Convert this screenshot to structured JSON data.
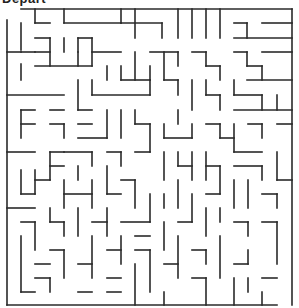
{
  "maze": {
    "start_label": "Depart",
    "wall_color": "#2a2a2a",
    "background": "#ffffff",
    "walls": [
      [
        21,
        9,
        292,
        9
      ],
      [
        7,
        20,
        7,
        305
      ],
      [
        7,
        305,
        277,
        305
      ],
      [
        292,
        9,
        292,
        305
      ],
      [
        21,
        23,
        21,
        50
      ],
      [
        21,
        52,
        35,
        52
      ],
      [
        7,
        52,
        21,
        52
      ],
      [
        21,
        64,
        21,
        80
      ],
      [
        35,
        9,
        35,
        23
      ],
      [
        35,
        23,
        50,
        23
      ],
      [
        64,
        9,
        64,
        23
      ],
      [
        64,
        23,
        121,
        23
      ],
      [
        121,
        9,
        121,
        23
      ],
      [
        121,
        23,
        162,
        23
      ],
      [
        78,
        38,
        92,
        38
      ],
      [
        64,
        38,
        64,
        52
      ],
      [
        35,
        38,
        50,
        38
      ],
      [
        35,
        52,
        50,
        52
      ],
      [
        50,
        38,
        50,
        66
      ],
      [
        35,
        66,
        92,
        66
      ],
      [
        78,
        52,
        78,
        66
      ],
      [
        78,
        38,
        78,
        52
      ],
      [
        92,
        38,
        92,
        66
      ],
      [
        92,
        52,
        121,
        52
      ],
      [
        107,
        66,
        107,
        80
      ],
      [
        135,
        9,
        135,
        38
      ],
      [
        162,
        23,
        162,
        38
      ],
      [
        178,
        9,
        178,
        38
      ],
      [
        192,
        9,
        192,
        38
      ],
      [
        206,
        9,
        206,
        38
      ],
      [
        220,
        9,
        220,
        38
      ],
      [
        234,
        23,
        247,
        23
      ],
      [
        247,
        23,
        247,
        38
      ],
      [
        262,
        23,
        292,
        23
      ],
      [
        234,
        38,
        292,
        38
      ],
      [
        150,
        52,
        178,
        52
      ],
      [
        178,
        52,
        178,
        66
      ],
      [
        192,
        52,
        206,
        52
      ],
      [
        206,
        52,
        206,
        66
      ],
      [
        206,
        66,
        220,
        66
      ],
      [
        220,
        66,
        220,
        80
      ],
      [
        234,
        52,
        247,
        52
      ],
      [
        247,
        52,
        247,
        66
      ],
      [
        247,
        66,
        262,
        66
      ],
      [
        262,
        66,
        262,
        80
      ],
      [
        247,
        80,
        292,
        80
      ],
      [
        262,
        52,
        292,
        52
      ],
      [
        164,
        52,
        164,
        80
      ],
      [
        135,
        52,
        135,
        80
      ],
      [
        150,
        66,
        150,
        80
      ],
      [
        121,
        66,
        121,
        80
      ],
      [
        121,
        80,
        150,
        80
      ],
      [
        7,
        95,
        64,
        95
      ],
      [
        78,
        80,
        78,
        110
      ],
      [
        92,
        80,
        92,
        95
      ],
      [
        92,
        95,
        150,
        95
      ],
      [
        150,
        80,
        150,
        95
      ],
      [
        164,
        80,
        178,
        80
      ],
      [
        178,
        80,
        178,
        95
      ],
      [
        192,
        80,
        192,
        110
      ],
      [
        206,
        80,
        206,
        95
      ],
      [
        206,
        95,
        220,
        95
      ],
      [
        220,
        95,
        220,
        110
      ],
      [
        234,
        80,
        234,
        95
      ],
      [
        234,
        95,
        262,
        95
      ],
      [
        262,
        95,
        262,
        110
      ],
      [
        277,
        95,
        277,
        110
      ],
      [
        234,
        110,
        292,
        110
      ],
      [
        21,
        110,
        21,
        138
      ],
      [
        21,
        110,
        35,
        110
      ],
      [
        21,
        124,
        35,
        124
      ],
      [
        50,
        110,
        64,
        110
      ],
      [
        50,
        124,
        64,
        124
      ],
      [
        64,
        124,
        64,
        138
      ],
      [
        78,
        110,
        92,
        110
      ],
      [
        78,
        124,
        92,
        124
      ],
      [
        78,
        138,
        107,
        138
      ],
      [
        107,
        110,
        107,
        138
      ],
      [
        121,
        110,
        121,
        138
      ],
      [
        135,
        110,
        135,
        124
      ],
      [
        135,
        124,
        150,
        124
      ],
      [
        150,
        124,
        150,
        152
      ],
      [
        164,
        124,
        164,
        138
      ],
      [
        164,
        138,
        192,
        138
      ],
      [
        192,
        124,
        192,
        138
      ],
      [
        178,
        110,
        178,
        124
      ],
      [
        206,
        124,
        220,
        124
      ],
      [
        220,
        124,
        220,
        138
      ],
      [
        220,
        138,
        234,
        138
      ],
      [
        234,
        124,
        234,
        152
      ],
      [
        234,
        152,
        262,
        152
      ],
      [
        262,
        124,
        262,
        138
      ],
      [
        248,
        124,
        262,
        124
      ],
      [
        277,
        124,
        292,
        124
      ],
      [
        7,
        152,
        35,
        152
      ],
      [
        50,
        152,
        64,
        152
      ],
      [
        50,
        152,
        50,
        180
      ],
      [
        50,
        166,
        64,
        166
      ],
      [
        64,
        152,
        92,
        152
      ],
      [
        92,
        152,
        92,
        166
      ],
      [
        107,
        152,
        121,
        152
      ],
      [
        121,
        152,
        121,
        166
      ],
      [
        135,
        152,
        150,
        152
      ],
      [
        164,
        152,
        164,
        180
      ],
      [
        178,
        152,
        178,
        166
      ],
      [
        178,
        166,
        192,
        166
      ],
      [
        192,
        152,
        192,
        180
      ],
      [
        206,
        152,
        206,
        180
      ],
      [
        206,
        166,
        220,
        166
      ],
      [
        220,
        166,
        220,
        194
      ],
      [
        234,
        166,
        262,
        166
      ],
      [
        262,
        166,
        262,
        180
      ],
      [
        277,
        152,
        277,
        180
      ],
      [
        277,
        180,
        292,
        180
      ],
      [
        21,
        170,
        21,
        194
      ],
      [
        21,
        194,
        35,
        194
      ],
      [
        35,
        170,
        35,
        194
      ],
      [
        35,
        180,
        50,
        180
      ],
      [
        64,
        180,
        64,
        208
      ],
      [
        64,
        194,
        92,
        194
      ],
      [
        78,
        166,
        78,
        180
      ],
      [
        92,
        180,
        92,
        208
      ],
      [
        107,
        166,
        107,
        194
      ],
      [
        107,
        194,
        121,
        194
      ],
      [
        121,
        180,
        135,
        180
      ],
      [
        135,
        180,
        135,
        208
      ],
      [
        150,
        194,
        150,
        222
      ],
      [
        164,
        194,
        164,
        208
      ],
      [
        178,
        180,
        178,
        208
      ],
      [
        192,
        194,
        192,
        222
      ],
      [
        206,
        194,
        220,
        194
      ],
      [
        234,
        180,
        234,
        208
      ],
      [
        248,
        180,
        248,
        208
      ],
      [
        262,
        194,
        277,
        194
      ],
      [
        277,
        194,
        277,
        208
      ],
      [
        7,
        208,
        35,
        208
      ],
      [
        21,
        222,
        35,
        222
      ],
      [
        35,
        222,
        35,
        250
      ],
      [
        50,
        208,
        50,
        222
      ],
      [
        50,
        222,
        64,
        222
      ],
      [
        64,
        222,
        64,
        236
      ],
      [
        78,
        208,
        78,
        236
      ],
      [
        92,
        222,
        107,
        222
      ],
      [
        107,
        208,
        107,
        236
      ],
      [
        121,
        222,
        150,
        222
      ],
      [
        135,
        236,
        150,
        236
      ],
      [
        164,
        222,
        164,
        250
      ],
      [
        178,
        222,
        192,
        222
      ],
      [
        206,
        208,
        206,
        236
      ],
      [
        220,
        208,
        220,
        222
      ],
      [
        234,
        222,
        248,
        222
      ],
      [
        248,
        222,
        248,
        236
      ],
      [
        262,
        222,
        277,
        222
      ],
      [
        277,
        222,
        277,
        264
      ],
      [
        21,
        236,
        21,
        292
      ],
      [
        50,
        250,
        64,
        250
      ],
      [
        64,
        250,
        64,
        278
      ],
      [
        78,
        264,
        92,
        264
      ],
      [
        92,
        236,
        92,
        278
      ],
      [
        107,
        250,
        121,
        250
      ],
      [
        121,
        236,
        121,
        264
      ],
      [
        135,
        250,
        150,
        250
      ],
      [
        150,
        250,
        150,
        292
      ],
      [
        164,
        264,
        178,
        264
      ],
      [
        178,
        236,
        178,
        278
      ],
      [
        192,
        250,
        206,
        250
      ],
      [
        206,
        250,
        206,
        264
      ],
      [
        220,
        236,
        220,
        278
      ],
      [
        234,
        264,
        248,
        264
      ],
      [
        248,
        250,
        248,
        264
      ],
      [
        262,
        278,
        277,
        278
      ],
      [
        35,
        264,
        50,
        264
      ],
      [
        35,
        278,
        50,
        278
      ],
      [
        50,
        278,
        50,
        292
      ],
      [
        21,
        292,
        35,
        292
      ],
      [
        78,
        292,
        92,
        292
      ],
      [
        107,
        278,
        121,
        278
      ],
      [
        107,
        292,
        121,
        292
      ],
      [
        135,
        264,
        135,
        305
      ],
      [
        164,
        292,
        164,
        305
      ],
      [
        192,
        278,
        206,
        278
      ],
      [
        206,
        278,
        206,
        305
      ],
      [
        234,
        278,
        234,
        305
      ],
      [
        262,
        292,
        262,
        305
      ],
      [
        248,
        278,
        248,
        292
      ]
    ]
  }
}
